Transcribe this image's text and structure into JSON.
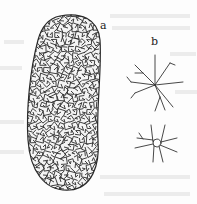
{
  "figure": {
    "panels": [
      {
        "label": "a",
        "description": "specimen habit"
      },
      {
        "label": "b",
        "description": "spicules"
      }
    ],
    "colors": {
      "ink": "#2a2a2a",
      "background": "#fdfdfd",
      "bleed": "#e6e6e6"
    }
  }
}
